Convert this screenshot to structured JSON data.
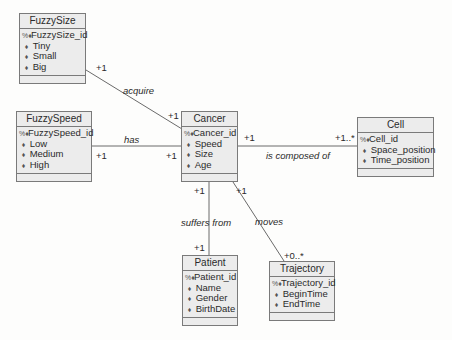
{
  "classes": {
    "fuzzysize": {
      "name": "FuzzySize",
      "pk": "FuzzySize_id",
      "attributes": [
        "Tiny",
        "Small",
        "Big"
      ]
    },
    "fuzzyspeed": {
      "name": "FuzzySpeed",
      "pk": "FuzzySpeed_id",
      "attributes": [
        "Low",
        "Medium",
        "High"
      ]
    },
    "cancer": {
      "name": "Cancer",
      "pk": "Cancer_id",
      "attributes": [
        "Speed",
        "Size",
        "Age"
      ]
    },
    "cell": {
      "name": "Cell",
      "pk": "Cell_id",
      "attributes": [
        "Space_position",
        "Time_position"
      ]
    },
    "patient": {
      "name": "Patient",
      "pk": "Patient_id",
      "attributes": [
        "Name",
        "Gender",
        "BirthDate"
      ]
    },
    "trajectory": {
      "name": "Trajectory",
      "pk": "Trajectory_id",
      "attributes": [
        "BeginTime",
        "EndTime"
      ]
    }
  },
  "associations": {
    "acquire": {
      "label": "acquire",
      "from_mult": "+1",
      "to_mult": "+1"
    },
    "has": {
      "label": "has",
      "from_mult": "+1",
      "to_mult": "+1"
    },
    "composed": {
      "label": "is composed of",
      "from_mult": "+1",
      "to_mult": "+1..*"
    },
    "suffers": {
      "label": "suffers from",
      "from_mult": "+1",
      "to_mult": "+1"
    },
    "moves": {
      "label": "moves",
      "from_mult": "+1",
      "to_mult": "+0..*"
    }
  },
  "icons": {
    "pk": "key-icon",
    "attribute": "attribute-icon"
  }
}
